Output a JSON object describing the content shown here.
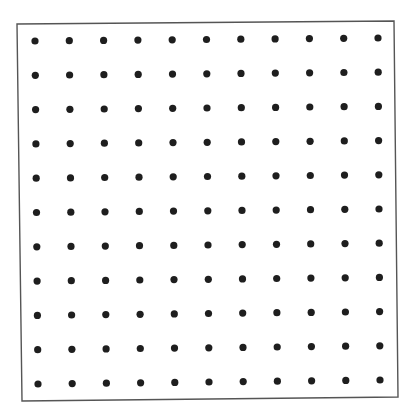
{
  "diagram": {
    "type": "dot-grid",
    "rows": 11,
    "columns": 11,
    "dot_spacing_px": 34.3,
    "dot_radius_px": 3.6,
    "dot_color": "#1e1e1e",
    "border_color": "#555555",
    "background": "#ffffff",
    "border_corners": {
      "top_left": [
        17,
        24
      ],
      "top_right": [
        394,
        21
      ],
      "bottom_right": [
        398,
        397
      ],
      "bottom_left": [
        22,
        401
      ]
    },
    "grid_corners": {
      "top_left": [
        35,
        41
      ],
      "top_right": [
        378,
        38
      ],
      "bottom_right": [
        380,
        380
      ],
      "bottom_left": [
        38,
        384
      ]
    }
  }
}
